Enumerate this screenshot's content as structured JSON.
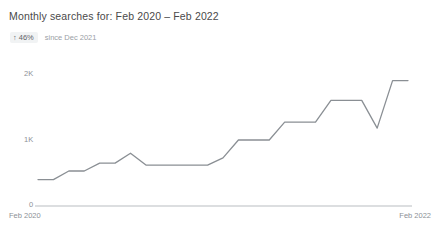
{
  "widget": {
    "title": "Monthly searches for: Feb 2020 – Feb 2022",
    "delta": {
      "arrow": "↑",
      "value": "46%",
      "since": "since Dec 2021"
    }
  },
  "colors": {
    "line": "#8a8f94",
    "axis": "#b9bdc1",
    "title_text": "#4a4a4a",
    "tick_text": "#8c9196",
    "badge_bg": "#f1f3f4",
    "background": "#ffffff"
  },
  "chart_data": {
    "type": "line",
    "title": "Monthly searches for: Feb 2020 – Feb 2022",
    "xlabel": "",
    "ylabel": "",
    "ylim": [
      0,
      2200
    ],
    "yticks": [
      0,
      1000,
      2000
    ],
    "ytick_labels": [
      "0",
      "1K",
      "2K"
    ],
    "xtick_labels": [
      "Feb 2020",
      "Feb 2022"
    ],
    "grid": false,
    "legend": "none",
    "categories": [
      "Feb 2020",
      "Mar 2020",
      "Apr 2020",
      "May 2020",
      "Jun 2020",
      "Jul 2020",
      "Aug 2020",
      "Sep 2020",
      "Oct 2020",
      "Nov 2020",
      "Dec 2020",
      "Jan 2021",
      "Feb 2021",
      "Mar 2021",
      "Apr 2021",
      "May 2021",
      "Jun 2021",
      "Jul 2021",
      "Aug 2021",
      "Sep 2021",
      "Oct 2021",
      "Nov 2021",
      "Dec 2021",
      "Jan 2022",
      "Feb 2022"
    ],
    "series": [
      {
        "name": "Monthly searches",
        "values": [
          400,
          400,
          530,
          530,
          650,
          650,
          800,
          620,
          620,
          620,
          620,
          620,
          730,
          1000,
          1000,
          1000,
          1270,
          1270,
          1270,
          1600,
          1600,
          1600,
          1180,
          1900,
          1900
        ]
      }
    ]
  }
}
